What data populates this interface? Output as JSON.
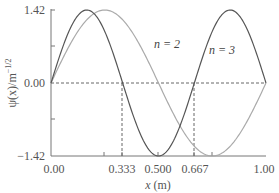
{
  "chart_data": {
    "type": "line",
    "title": "",
    "xlabel": "x (m)",
    "ylabel": "ψ(x)/m^−1/2",
    "xlim": [
      0,
      1
    ],
    "ylim": [
      -1.42,
      1.42
    ],
    "x_ticks": [
      "0.00",
      "0.333",
      "0.500",
      "0.667",
      "1.00"
    ],
    "y_ticks": [
      "1.42",
      "0.00",
      "−1.42"
    ],
    "grid": false,
    "series": [
      {
        "name": "n = 2",
        "function": "1.42*sin(2*pi*x)",
        "color": "#aaaaaa",
        "x": [
          0,
          0.125,
          0.25,
          0.375,
          0.5,
          0.625,
          0.75,
          0.875,
          1.0
        ],
        "values": [
          0,
          1.0,
          1.42,
          1.0,
          0,
          -1.0,
          -1.42,
          -1.0,
          0
        ]
      },
      {
        "name": "n = 3",
        "function": "1.42*sin(3*pi*x)",
        "color": "#555555",
        "x": [
          0,
          0.1667,
          0.333,
          0.5,
          0.667,
          0.8333,
          1.0
        ],
        "values": [
          0,
          1.42,
          0,
          -1.42,
          0,
          1.42,
          0
        ]
      }
    ],
    "annotations": [
      {
        "text": "n = 2",
        "x": 0.72,
        "y": 0.8
      },
      {
        "text": "n = 3",
        "x": 0.75,
        "y": 0.7
      },
      {
        "type": "dashed-hline",
        "y": 0
      },
      {
        "type": "dashed-vline",
        "x": 0.333
      },
      {
        "type": "dashed-vline",
        "x": 0.667
      }
    ]
  },
  "labels": {
    "y_top": "1.42",
    "y_mid": "0.00",
    "y_bot": "−1.42",
    "x0": "0.00",
    "x1": "0.333",
    "x2": "0.500",
    "x3": "0.667",
    "x4": "1.00",
    "xlabel_var": "x",
    "xlabel_unit": " (m)",
    "ylabel": "ψ(x)/m",
    "ylabel_exp": "−1/2",
    "n2": "n = 2",
    "n3": "n = 3"
  }
}
